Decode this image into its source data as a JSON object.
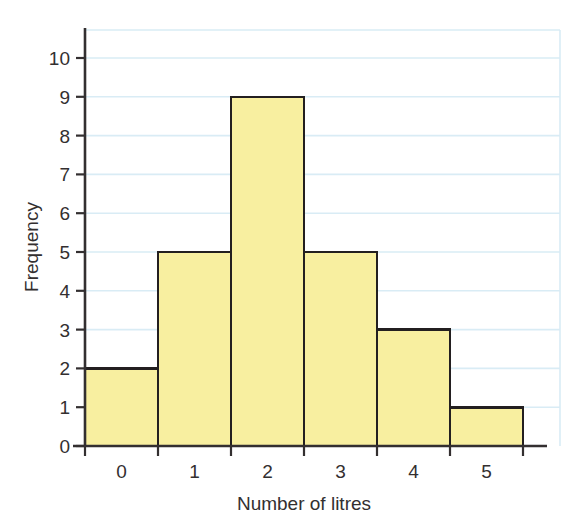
{
  "chart_data": {
    "type": "bar",
    "title": "",
    "subtitle": "",
    "xlabel": "Number of litres",
    "ylabel": "Frequency",
    "categories": [
      "0",
      "1",
      "2",
      "3",
      "4",
      "5"
    ],
    "values": [
      2,
      5,
      9,
      5,
      3,
      1
    ],
    "ylim": [
      0,
      10
    ],
    "ytick_labels": [
      "0",
      "1",
      "2",
      "3",
      "4",
      "5",
      "6",
      "7",
      "8",
      "9",
      "10"
    ],
    "ytick_values": [
      0,
      1,
      2,
      3,
      4,
      5,
      6,
      7,
      8,
      9,
      10
    ],
    "xtick_labels": [
      "0",
      "1",
      "2",
      "3",
      "4",
      "5"
    ],
    "grid": true,
    "grid_axis": "y",
    "legend": false,
    "legend_position": "none",
    "series": [
      {
        "name": "Frequency",
        "values": [
          2,
          5,
          9,
          5,
          3,
          1
        ]
      }
    ],
    "annotations": []
  },
  "style": {
    "bar_fill": "#f8efa0",
    "bar_stroke": "#231f20",
    "grid_color": "#d9ecf5",
    "axis_color": "#332f30",
    "text_color": "#332f30",
    "background": "#ffffff"
  },
  "labels": {
    "x_axis_title": "Number of litres",
    "y_axis_title": "Frequency"
  }
}
